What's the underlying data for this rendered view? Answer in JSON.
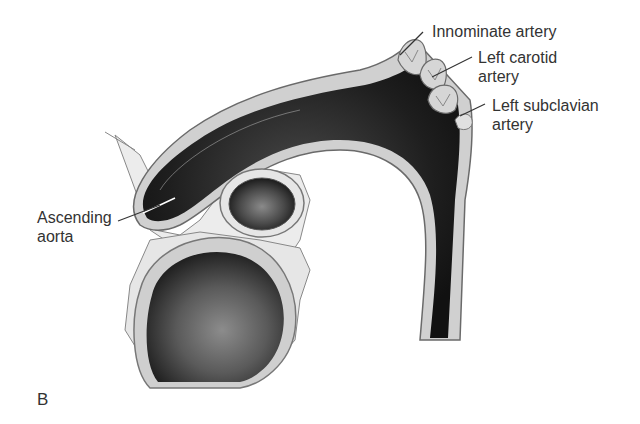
{
  "figure": {
    "panel_label": "B",
    "labels": {
      "innominate": "Innominate artery",
      "left_carotid_line1": "Left carotid",
      "left_carotid_line2": "artery",
      "left_subclavian_line1": "Left subclavian",
      "left_subclavian_line2": "artery",
      "ascending_line1": "Ascending",
      "ascending_line2": "aorta"
    },
    "colors": {
      "lumen": "#1e1e1e",
      "wall": "#c8c8c8",
      "tissue": "#e6e6e6",
      "outline": "#6a6a6a",
      "text": "#333333"
    }
  }
}
